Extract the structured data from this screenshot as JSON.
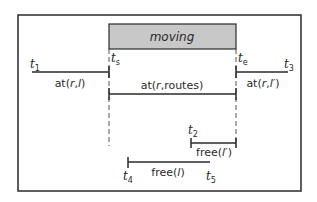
{
  "diagram": {
    "type": "timeline",
    "colors": {
      "border": "#2a2a2a",
      "line": "#2a2a2a",
      "action_fill": "#c8c8c8",
      "background": "#ffffff"
    },
    "action": {
      "label": "moving",
      "start_label": "t",
      "start_sub": "s",
      "end_label": "t",
      "end_sub": "e"
    },
    "intervals": [
      {
        "id": "at-r-l",
        "label_prefix": "at(",
        "label_r": "r",
        "label_sep": ",",
        "label_arg": "l",
        "label_suffix": ")",
        "start_time": "t",
        "start_sub": "1",
        "end_time": "t",
        "end_sub": "s"
      },
      {
        "id": "at-r-routes",
        "label_prefix": "at(",
        "label_r": "r",
        "label_sep": ",routes)",
        "start_time": "t",
        "start_sub": "s",
        "end_time": "t",
        "end_sub": "e"
      },
      {
        "id": "at-r-lprime",
        "label_prefix": "at(",
        "label_r": "r",
        "label_sep": ",",
        "label_arg": "l′",
        "label_suffix": ")",
        "start_time": "t",
        "start_sub": "e",
        "end_time": "t",
        "end_sub": "3"
      },
      {
        "id": "free-lprime",
        "label_prefix": "free(",
        "label_arg": "l′",
        "label_suffix": ")",
        "start_time": "t",
        "start_sub": "2",
        "end_time": "t",
        "end_sub": "e"
      },
      {
        "id": "free-l",
        "label_prefix": "free(",
        "label_arg": "l",
        "label_suffix": ")",
        "start_time": "t",
        "start_sub": "4",
        "end_time": "t",
        "end_sub": "5"
      }
    ]
  }
}
